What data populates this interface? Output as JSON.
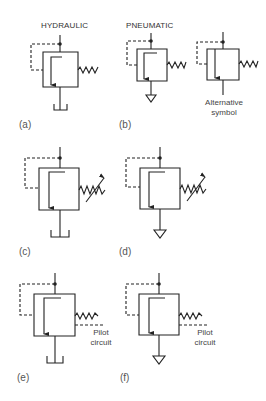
{
  "headers": {
    "hydraulic": "HYDRAULIC",
    "pneumatic": "PNEUMATIC"
  },
  "panels": [
    {
      "id": "a",
      "label": "(a)",
      "medium": "hydraulic",
      "spring": "fixed",
      "exhaust": "tank",
      "pilot_circuit": false
    },
    {
      "id": "b",
      "label": "(b)",
      "medium": "pneumatic",
      "spring": "fixed",
      "exhaust": "atmosphere",
      "pilot_circuit": false
    },
    {
      "id": "b-alt",
      "label": "",
      "medium": "pneumatic",
      "spring": "fixed",
      "exhaust": "line",
      "pilot_circuit": false,
      "note_line1": "Alternative",
      "note_line2": "symbol"
    },
    {
      "id": "c",
      "label": "(c)",
      "medium": "hydraulic",
      "spring": "adjustable",
      "exhaust": "tank",
      "pilot_circuit": false
    },
    {
      "id": "d",
      "label": "(d)",
      "medium": "pneumatic",
      "spring": "adjustable",
      "exhaust": "atmosphere",
      "pilot_circuit": false
    },
    {
      "id": "e",
      "label": "(e)",
      "medium": "hydraulic",
      "spring": "fixed",
      "exhaust": "tank",
      "pilot_circuit": true,
      "note_line1": "Pilot",
      "note_line2": "circuit"
    },
    {
      "id": "f",
      "label": "(f)",
      "medium": "pneumatic",
      "spring": "fixed",
      "exhaust": "atmosphere",
      "pilot_circuit": true,
      "note_line1": "Pilot",
      "note_line2": "circuit"
    }
  ],
  "colors": {
    "stroke": "#222222",
    "text": "#333333",
    "background": "#ffffff"
  }
}
